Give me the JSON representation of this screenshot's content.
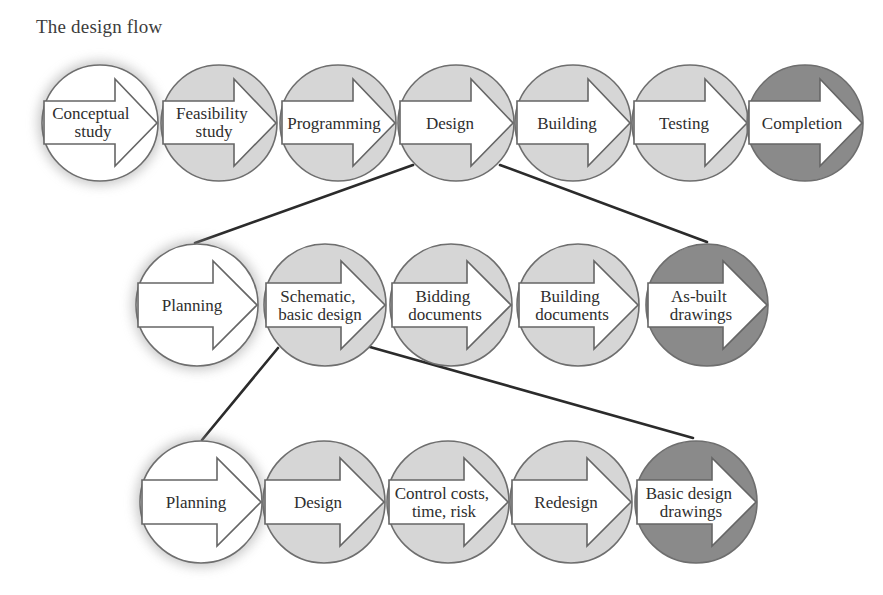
{
  "title": "The design flow",
  "colors": {
    "start_fill": "#ffffff",
    "step_fill": "#d6d6d6",
    "end_fill": "#8a8a8a",
    "outline": "#6e6e6e",
    "connector": "#2b2b2b"
  },
  "rows": [
    {
      "level": "project lifecycle",
      "steps": [
        {
          "lines": [
            "Conceptual",
            "study"
          ],
          "style": "start"
        },
        {
          "lines": [
            "Feasibility",
            "study"
          ],
          "style": "step"
        },
        {
          "lines": [
            "Programming"
          ],
          "style": "step"
        },
        {
          "lines": [
            "Design"
          ],
          "style": "step"
        },
        {
          "lines": [
            "Building"
          ],
          "style": "step"
        },
        {
          "lines": [
            "Testing"
          ],
          "style": "step"
        },
        {
          "lines": [
            "Completion"
          ],
          "style": "end"
        }
      ]
    },
    {
      "level": "design phase (expands Design)",
      "steps": [
        {
          "lines": [
            "Planning"
          ],
          "style": "start"
        },
        {
          "lines": [
            "Schematic,",
            "basic design"
          ],
          "style": "step"
        },
        {
          "lines": [
            "Bidding",
            "documents"
          ],
          "style": "step"
        },
        {
          "lines": [
            "Building",
            "documents"
          ],
          "style": "step"
        },
        {
          "lines": [
            "As-built",
            "drawings"
          ],
          "style": "end"
        }
      ]
    },
    {
      "level": "schematic design (expands Schematic, basic design)",
      "steps": [
        {
          "lines": [
            "Planning"
          ],
          "style": "start"
        },
        {
          "lines": [
            "Design"
          ],
          "style": "step"
        },
        {
          "lines": [
            "Control costs,",
            "time, risk"
          ],
          "style": "step"
        },
        {
          "lines": [
            "Redesign"
          ],
          "style": "step"
        },
        {
          "lines": [
            "Basic design",
            "drawings"
          ],
          "style": "end"
        }
      ]
    }
  ],
  "connectors": [
    {
      "from": "Design",
      "to": "Planning (row 2)"
    },
    {
      "from": "Design",
      "to": "As-built drawings"
    },
    {
      "from": "Schematic, basic design",
      "to": "Planning (row 3)"
    },
    {
      "from": "Schematic, basic design",
      "to": "Basic design drawings"
    }
  ]
}
